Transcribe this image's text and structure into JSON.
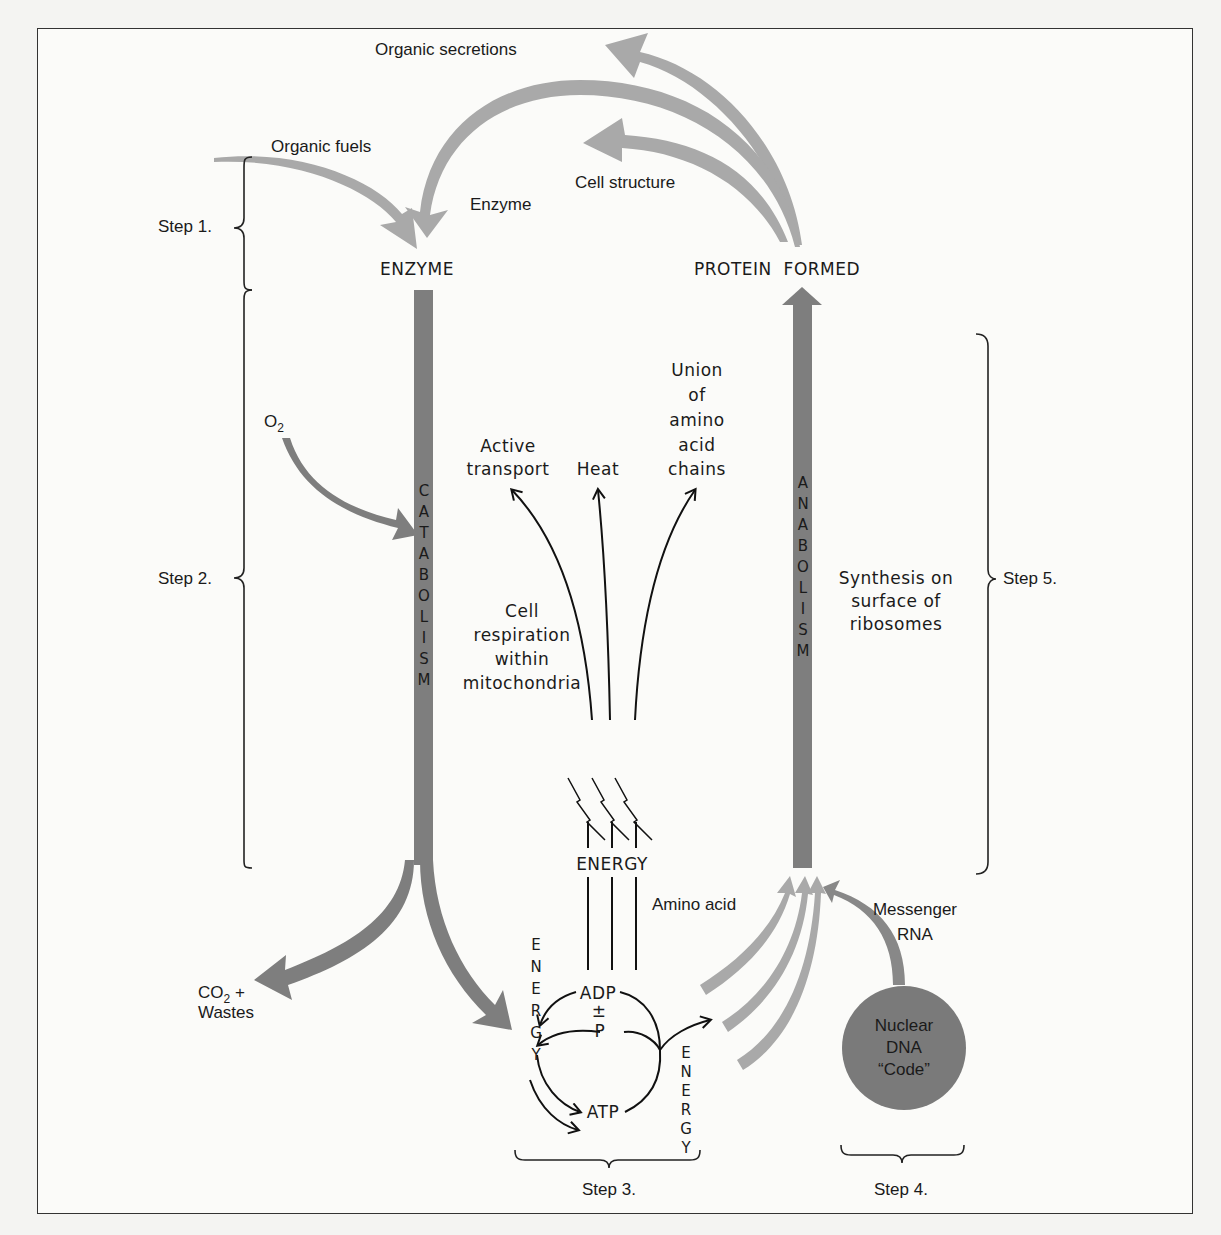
{
  "diagram": {
    "title_labels": {
      "organic_secretions": "Organic secretions",
      "organic_fuels": "Organic fuels",
      "cell_structure": "Cell structure",
      "enzyme_return": "Enzyme",
      "enzyme_node": "ENZYME",
      "protein_formed": "PROTEIN  FORMED"
    },
    "steps": {
      "step1": "Step 1.",
      "step2": "Step 2.",
      "step3": "Step 3.",
      "step4": "Step 4.",
      "step5": "Step 5."
    },
    "catabolism": {
      "o2_label": "O",
      "o2_sub": "2",
      "letters": [
        "C",
        "A",
        "T",
        "A",
        "B",
        "O",
        "L",
        "I",
        "S",
        "M"
      ],
      "co2_label": "CO",
      "co2_sub": "2",
      "co2_plus": " +",
      "wastes": "Wastes"
    },
    "anabolism": {
      "letters": [
        "A",
        "N",
        "A",
        "B",
        "O",
        "L",
        "I",
        "S",
        "M"
      ],
      "synthesis_lines": [
        "Synthesis on",
        "surface of",
        "ribosomes"
      ]
    },
    "energy_uses": {
      "active_transport": [
        "Active",
        "transport"
      ],
      "heat": [
        "Heat"
      ],
      "union": [
        "Union",
        "of",
        "amino",
        "acid",
        "chains"
      ],
      "cell_respiration": [
        "Cell",
        "respiration",
        "within",
        "mitochondria"
      ],
      "energy_label": "ENERGY"
    },
    "atp_cycle": {
      "adp": "ADP",
      "plus_minus": "±",
      "p": "P",
      "atp": "ATP",
      "energy_left": [
        "E",
        "N",
        "E",
        "R",
        "G",
        "Y"
      ],
      "energy_right": [
        "E",
        "N",
        "E",
        "R",
        "G",
        "Y"
      ]
    },
    "protein_synthesis": {
      "amino_acid": "Amino acid",
      "messenger_rna": [
        "Messenger",
        "RNA"
      ],
      "nuclear_dna": [
        "Nuclear",
        "DNA",
        "“Code”"
      ]
    },
    "colors": {
      "light_arrow": "#a9a9a9",
      "dark_arrow": "#7e7e7e",
      "nucleus": "#7a7a7a",
      "ink": "#1a1a1a"
    }
  }
}
